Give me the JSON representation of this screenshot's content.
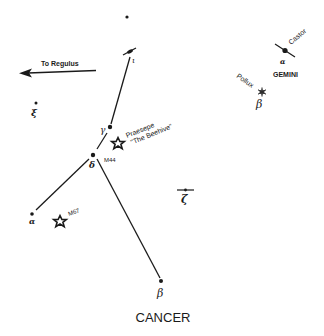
{
  "title": "CANCER",
  "colors": {
    "ink": "#1a1a1a",
    "background": "#ffffff"
  },
  "pointer": {
    "label": "To Regulus"
  },
  "stars": {
    "iota": {
      "symbol": "ι"
    },
    "gamma": {
      "symbol": "γ"
    },
    "delta": {
      "symbol": "δ"
    },
    "alpha": {
      "symbol": "α"
    },
    "beta": {
      "symbol": "β"
    },
    "zeta": {
      "symbol": "ζ"
    },
    "xi": {
      "symbol": "ξ"
    }
  },
  "clusters": {
    "m44": {
      "label": "M44",
      "name_line1": "Praesepe",
      "name_line2": "\"The Beehive\""
    },
    "m67": {
      "label": "M67"
    }
  },
  "gemini": {
    "label": "GEMINI",
    "castor": {
      "name": "Castor",
      "symbol": "α"
    },
    "pollux": {
      "name": "Pollux",
      "symbol": "β"
    }
  }
}
